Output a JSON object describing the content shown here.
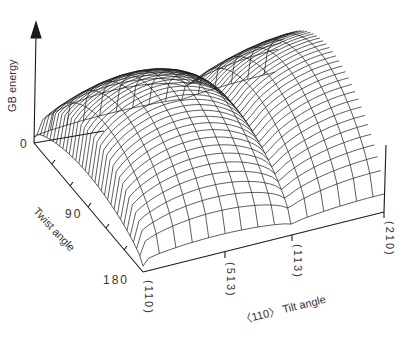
{
  "figure": {
    "type": "3d-surface-wireframe",
    "z_axis_label": "GB energy",
    "z_origin_label": "0",
    "twist_axis_label": "Twist angle",
    "twist_ticks": [
      "0",
      "90",
      "180"
    ],
    "tilt_axis_label": "〈110〉 Tilt angle",
    "tilt_ticks": [
      "(110)",
      "(513)",
      "(113)",
      "(210)"
    ]
  },
  "colors": {
    "line": "#1a1a1a",
    "background": "#ffffff"
  }
}
